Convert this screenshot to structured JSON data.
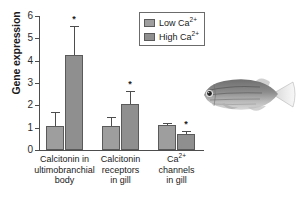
{
  "figure": {
    "ylabel": "Gene expression"
  },
  "axes": {
    "yticks": [
      "0",
      "1",
      "2",
      "3",
      "4",
      "5",
      "6"
    ],
    "ylim": [
      0,
      6
    ]
  },
  "legend": {
    "items": [
      {
        "label_text": "Low Ca",
        "sup": "2+",
        "key": "low",
        "color": "#9e9e9e"
      },
      {
        "label_text": "High Ca",
        "sup": "2+",
        "key": "high",
        "color": "#8f8f8f"
      }
    ]
  },
  "categories": [
    {
      "line1": "Calcitonin in",
      "line2": "ultimobranchial",
      "line3": "body"
    },
    {
      "line1": "Calcitonin",
      "line2": "receptors",
      "line3": "in gill"
    },
    {
      "line1": "Ca",
      "line1_sup": "2+",
      "line2": "channels",
      "line3": "in gill"
    }
  ],
  "annotations": {
    "significance_marker": "*"
  },
  "chart_data": {
    "type": "bar",
    "title": "",
    "xlabel": "",
    "ylabel": "Gene expression",
    "ylim": [
      0,
      6
    ],
    "yticks": [
      0,
      1,
      2,
      3,
      4,
      5,
      6
    ],
    "grid": false,
    "legend_position": "top-right",
    "categories": [
      "Calcitonin in ultimobranchial body",
      "Calcitonin receptors in gill",
      "Ca2+ channels in gill"
    ],
    "series": [
      {
        "name": "Low Ca2+",
        "color": "#9e9e9e",
        "values": [
          1.08,
          1.08,
          1.1
        ],
        "errors": [
          0.62,
          0.38,
          0.1
        ],
        "significant": [
          false,
          false,
          false
        ]
      },
      {
        "name": "High Ca2+",
        "color": "#8f8f8f",
        "values": [
          4.25,
          2.08,
          0.72
        ],
        "errors": [
          1.3,
          0.57,
          0.13
        ],
        "significant": [
          true,
          true,
          true
        ]
      }
    ],
    "significance_marker": "*"
  },
  "inset": {
    "image_name": "zebrafish-photo"
  }
}
